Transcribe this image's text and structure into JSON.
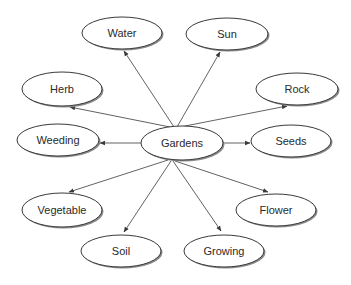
{
  "diagram": {
    "type": "concept-map",
    "center": {
      "id": "gardens",
      "label": "Gardens",
      "cx": 182,
      "cy": 143,
      "rx": 41,
      "ry": 17
    },
    "nodes": [
      {
        "id": "water",
        "label": "Water",
        "cx": 122,
        "cy": 33,
        "rx": 40,
        "ry": 16
      },
      {
        "id": "sun",
        "label": "Sun",
        "cx": 227,
        "cy": 34,
        "rx": 41,
        "ry": 16
      },
      {
        "id": "herb",
        "label": "Herb",
        "cx": 62,
        "cy": 89,
        "rx": 40,
        "ry": 17
      },
      {
        "id": "rock",
        "label": "Rock",
        "cx": 297,
        "cy": 89,
        "rx": 41,
        "ry": 16
      },
      {
        "id": "weeding",
        "label": "Weeding",
        "cx": 58,
        "cy": 140,
        "rx": 41,
        "ry": 16
      },
      {
        "id": "seeds",
        "label": "Seeds",
        "cx": 291,
        "cy": 141,
        "rx": 40,
        "ry": 16
      },
      {
        "id": "vegetable",
        "label": "Vegetable",
        "cx": 62,
        "cy": 210,
        "rx": 40,
        "ry": 17
      },
      {
        "id": "flower",
        "label": "Flower",
        "cx": 276,
        "cy": 210,
        "rx": 40,
        "ry": 16
      },
      {
        "id": "soil",
        "label": "Soil",
        "cx": 121,
        "cy": 251,
        "rx": 40,
        "ry": 16
      },
      {
        "id": "growing",
        "label": "Growing",
        "cx": 224,
        "cy": 251,
        "rx": 40,
        "ry": 16
      }
    ],
    "edges": [
      {
        "from": "gardens",
        "to": "water",
        "x1": 174,
        "y1": 127,
        "x2": 124,
        "y2": 51
      },
      {
        "from": "gardens",
        "to": "sun",
        "x1": 177,
        "y1": 127,
        "x2": 220,
        "y2": 52
      },
      {
        "from": "gardens",
        "to": "herb",
        "x1": 170,
        "y1": 127,
        "x2": 70,
        "y2": 107
      },
      {
        "from": "gardens",
        "to": "rock",
        "x1": 180,
        "y1": 127,
        "x2": 287,
        "y2": 106
      },
      {
        "from": "gardens",
        "to": "weeding",
        "x1": 141,
        "y1": 143,
        "x2": 100,
        "y2": 143
      },
      {
        "from": "gardens",
        "to": "seeds",
        "x1": 223,
        "y1": 143,
        "x2": 250,
        "y2": 143
      },
      {
        "from": "gardens",
        "to": "vegetable",
        "x1": 168,
        "y1": 160,
        "x2": 69,
        "y2": 192
      },
      {
        "from": "gardens",
        "to": "flower",
        "x1": 175,
        "y1": 161,
        "x2": 268,
        "y2": 192
      },
      {
        "from": "gardens",
        "to": "soil",
        "x1": 171,
        "y1": 161,
        "x2": 124,
        "y2": 232
      },
      {
        "from": "gardens",
        "to": "growing",
        "x1": 173,
        "y1": 161,
        "x2": 221,
        "y2": 231
      }
    ],
    "colors": {
      "stroke": "#3a3a3a",
      "fill": "#ffffff",
      "shadow": "#8a8a8a",
      "text": "#2a2a2a"
    }
  }
}
